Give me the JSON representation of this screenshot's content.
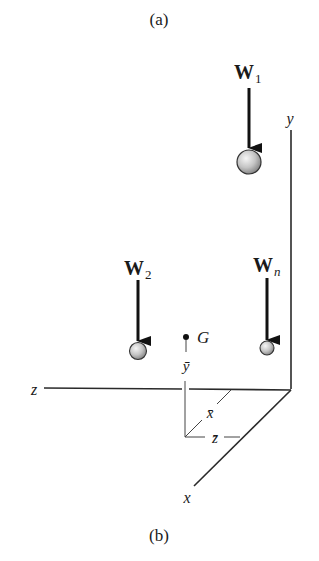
{
  "captions": {
    "top": "(a)",
    "bottom": "(b)"
  },
  "weights": [
    {
      "symbol": "W",
      "subscript": "1"
    },
    {
      "symbol": "W",
      "subscript": "2"
    },
    {
      "symbol": "W",
      "subscript": "n"
    }
  ],
  "centroid": {
    "label": "G",
    "x_bar": "x̄",
    "y_bar": "ȳ",
    "z_bar": "z̄"
  },
  "axes": {
    "x": "x",
    "y": "y",
    "z": "z"
  },
  "colors": {
    "line": "#2a2a2a",
    "sphere_light": "#f4f4f4",
    "sphere_dark": "#8a8a8a",
    "background": "#ffffff"
  }
}
